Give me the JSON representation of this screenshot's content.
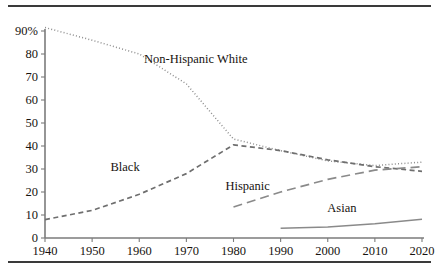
{
  "figure": {
    "background": "#ffffff",
    "rule_color": "#3a3a3a",
    "axis_color": "#7b7b7b"
  },
  "chart_data": {
    "type": "line",
    "title": "",
    "subtitle": "",
    "xlabel": "",
    "ylabel": "",
    "xlim": [
      1940,
      2020
    ],
    "ylim": [
      0,
      90
    ],
    "grid": false,
    "legend": "inline-annotations",
    "x_ticks": [
      1940,
      1950,
      1960,
      1970,
      1980,
      1990,
      2000,
      2010,
      2020
    ],
    "x_tick_labels": [
      "1940",
      "1950",
      "1960",
      "1970",
      "1980",
      "1990",
      "2000",
      "2010",
      "2020"
    ],
    "y_ticks": [
      0,
      10,
      20,
      30,
      40,
      50,
      60,
      70,
      80,
      90
    ],
    "y_tick_labels": [
      "0",
      "10",
      "20",
      "30",
      "40",
      "50",
      "60",
      "70",
      "80",
      "90%"
    ],
    "series": [
      {
        "name": "Non-Hispanic White",
        "label": "Non-Hispanic White",
        "style": "dotted",
        "color": "#8e8e8e",
        "width": 1.5,
        "dash": "1,2.2",
        "label_x": 1972,
        "label_y": 76,
        "x": [
          1940,
          1950,
          1960,
          1970,
          1980,
          1990,
          2000,
          2010,
          2020
        ],
        "values": [
          91.5,
          86,
          80,
          67,
          43,
          38,
          33.5,
          31.5,
          33
        ]
      },
      {
        "name": "Black",
        "label": "Black",
        "style": "dashed",
        "color": "#6f6f6f",
        "width": 1.7,
        "dash": "5,3.5",
        "label_x": 1957,
        "label_y": 29,
        "x": [
          1940,
          1950,
          1960,
          1970,
          1980,
          1990,
          2000,
          2010,
          2020
        ],
        "values": [
          8,
          12,
          19,
          28,
          40.5,
          38,
          34,
          31,
          29
        ]
      },
      {
        "name": "Hispanic",
        "label": "Hispanic",
        "style": "long-dashed",
        "color": "#8a8a8a",
        "width": 1.7,
        "dash": "9,5",
        "label_x": 1983,
        "label_y": 21,
        "x": [
          1980,
          1990,
          2000,
          2010,
          2020
        ],
        "values": [
          13.5,
          20,
          25.5,
          29.5,
          31
        ]
      },
      {
        "name": "Asian",
        "label": "Asian",
        "style": "solid",
        "color": "#8a8a8a",
        "width": 1.5,
        "dash": "none",
        "label_x": 2003,
        "label_y": 11.5,
        "x": [
          1990,
          2000,
          2010,
          2020
        ],
        "values": [
          4.2,
          4.8,
          6.2,
          8.2
        ]
      }
    ]
  }
}
